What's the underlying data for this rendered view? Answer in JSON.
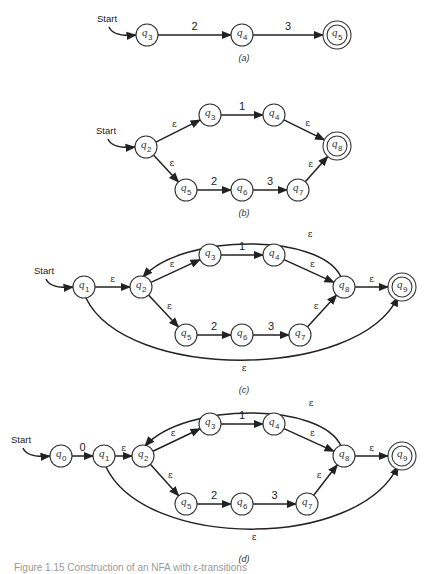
{
  "figure": {
    "caption": "Figure 1.15 Construction of an NFA with ε-transitions",
    "start_label": "Start",
    "diagrams": [
      {
        "id": "a",
        "label": "(a)",
        "start_state": "q3",
        "states": [
          {
            "id": "q3",
            "sub": "3",
            "x": 147,
            "y": 35,
            "final": false
          },
          {
            "id": "q4",
            "sub": "4",
            "x": 242,
            "y": 35,
            "final": false
          },
          {
            "id": "q5",
            "sub": "5",
            "x": 337,
            "y": 35,
            "final": true
          }
        ],
        "transitions": [
          {
            "from": "q3",
            "to": "q4",
            "label": "2"
          },
          {
            "from": "q4",
            "to": "q5",
            "label": "3"
          }
        ]
      },
      {
        "id": "b",
        "label": "(b)",
        "start_state": "q2",
        "states": [
          {
            "id": "q2",
            "sub": "2",
            "x": 146,
            "y": 147,
            "final": false
          },
          {
            "id": "q3",
            "sub": "3",
            "x": 210,
            "y": 115,
            "final": false
          },
          {
            "id": "q4",
            "sub": "4",
            "x": 274,
            "y": 115,
            "final": false
          },
          {
            "id": "q8",
            "sub": "8",
            "x": 337,
            "y": 146,
            "final": true
          },
          {
            "id": "q5",
            "sub": "5",
            "x": 186,
            "y": 190,
            "final": false
          },
          {
            "id": "q6",
            "sub": "6",
            "x": 242,
            "y": 190,
            "final": false
          },
          {
            "id": "q7",
            "sub": "7",
            "x": 298,
            "y": 190,
            "final": false
          }
        ],
        "transitions": [
          {
            "from": "q2",
            "to": "q3",
            "label": "ε"
          },
          {
            "from": "q3",
            "to": "q4",
            "label": "1"
          },
          {
            "from": "q4",
            "to": "q8",
            "label": "ε"
          },
          {
            "from": "q2",
            "to": "q5",
            "label": "ε"
          },
          {
            "from": "q5",
            "to": "q6",
            "label": "2"
          },
          {
            "from": "q6",
            "to": "q7",
            "label": "3"
          },
          {
            "from": "q7",
            "to": "q8",
            "label": "ε"
          }
        ]
      },
      {
        "id": "c",
        "label": "(c)",
        "start_state": "q1",
        "states": [
          {
            "id": "q1",
            "sub": "1",
            "x": 84,
            "y": 287,
            "final": false
          },
          {
            "id": "q2",
            "sub": "2",
            "x": 141,
            "y": 287,
            "final": false
          },
          {
            "id": "q3",
            "sub": "3",
            "x": 210,
            "y": 255,
            "final": false
          },
          {
            "id": "q4",
            "sub": "4",
            "x": 274,
            "y": 255,
            "final": false
          },
          {
            "id": "q8",
            "sub": "8",
            "x": 344,
            "y": 287,
            "final": false
          },
          {
            "id": "q9",
            "sub": "9",
            "x": 402,
            "y": 287,
            "final": true
          },
          {
            "id": "q5",
            "sub": "5",
            "x": 186,
            "y": 335,
            "final": false
          },
          {
            "id": "q6",
            "sub": "6",
            "x": 242,
            "y": 335,
            "final": false
          },
          {
            "id": "q7",
            "sub": "7",
            "x": 300,
            "y": 335,
            "final": false
          }
        ],
        "transitions": [
          {
            "from": "q1",
            "to": "q2",
            "label": "ε"
          },
          {
            "from": "q2",
            "to": "q3",
            "label": "ε"
          },
          {
            "from": "q3",
            "to": "q4",
            "label": "1"
          },
          {
            "from": "q4",
            "to": "q8",
            "label": "ε"
          },
          {
            "from": "q2",
            "to": "q5",
            "label": "ε"
          },
          {
            "from": "q5",
            "to": "q6",
            "label": "2"
          },
          {
            "from": "q6",
            "to": "q7",
            "label": "3"
          },
          {
            "from": "q7",
            "to": "q8",
            "label": "ε"
          },
          {
            "from": "q8",
            "to": "q9",
            "label": "ε"
          },
          {
            "from": "q8",
            "to": "q2",
            "label": "ε",
            "curve": "over"
          },
          {
            "from": "q1",
            "to": "q9",
            "label": "ε",
            "curve": "under"
          }
        ]
      },
      {
        "id": "d",
        "label": "(d)",
        "start_state": "q0",
        "states": [
          {
            "id": "q0",
            "sub": "0",
            "x": 61,
            "y": 456,
            "final": false
          },
          {
            "id": "q1",
            "sub": "1",
            "x": 104,
            "y": 456,
            "final": false
          },
          {
            "id": "q2",
            "sub": "2",
            "x": 143,
            "y": 456,
            "final": false
          },
          {
            "id": "q3",
            "sub": "3",
            "x": 210,
            "y": 424,
            "final": false
          },
          {
            "id": "q4",
            "sub": "4",
            "x": 274,
            "y": 424,
            "final": false
          },
          {
            "id": "q8",
            "sub": "8",
            "x": 344,
            "y": 456,
            "final": false
          },
          {
            "id": "q9",
            "sub": "9",
            "x": 402,
            "y": 456,
            "final": true
          },
          {
            "id": "q5",
            "sub": "5",
            "x": 186,
            "y": 504,
            "final": false
          },
          {
            "id": "q6",
            "sub": "6",
            "x": 242,
            "y": 504,
            "final": false
          },
          {
            "id": "q7",
            "sub": "7",
            "x": 307,
            "y": 504,
            "final": false
          }
        ],
        "transitions": [
          {
            "from": "q0",
            "to": "q1",
            "label": "0"
          },
          {
            "from": "q1",
            "to": "q2",
            "label": "ε"
          },
          {
            "from": "q2",
            "to": "q3",
            "label": "ε"
          },
          {
            "from": "q3",
            "to": "q4",
            "label": "1"
          },
          {
            "from": "q4",
            "to": "q8",
            "label": "ε"
          },
          {
            "from": "q2",
            "to": "q5",
            "label": "ε"
          },
          {
            "from": "q5",
            "to": "q6",
            "label": "2"
          },
          {
            "from": "q6",
            "to": "q7",
            "label": "3"
          },
          {
            "from": "q7",
            "to": "q8",
            "label": "ε"
          },
          {
            "from": "q8",
            "to": "q9",
            "label": "ε"
          },
          {
            "from": "q8",
            "to": "q2",
            "label": "ε",
            "curve": "over"
          },
          {
            "from": "q1",
            "to": "q9",
            "label": "ε",
            "curve": "under"
          }
        ]
      }
    ]
  }
}
